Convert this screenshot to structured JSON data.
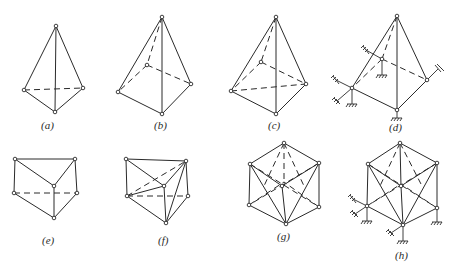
{
  "figure": {
    "panels": [
      {
        "id": "a",
        "label": "(a)",
        "description": "triangular pyramid (tetrahedron) space truss"
      },
      {
        "id": "b",
        "label": "(b)",
        "description": "square pyramid space truss"
      },
      {
        "id": "c",
        "label": "(c)",
        "description": "square pyramid space truss with base diagonal"
      },
      {
        "id": "d",
        "label": "(d)",
        "description": "square pyramid space truss with supports"
      },
      {
        "id": "e",
        "label": "(e)",
        "description": "triangular prism space truss"
      },
      {
        "id": "f",
        "label": "(f)",
        "description": "triangular prism space truss with diagonals"
      },
      {
        "id": "g",
        "label": "(g)",
        "description": "cube space truss with face diagonals"
      },
      {
        "id": "h",
        "label": "(h)",
        "description": "cube space truss with face diagonals and supports"
      }
    ]
  },
  "colors": {
    "line": "#2a2a2a",
    "background": "#ffffff"
  }
}
